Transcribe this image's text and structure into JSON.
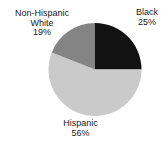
{
  "chart_data": {
    "type": "pie",
    "title": "",
    "legend": "none",
    "start_angle_deg": 0,
    "direction": "clockwise",
    "slices": [
      {
        "label": "Black",
        "display_lines": [
          "Black"
        ],
        "pct_label": "25%",
        "value": 25,
        "color": "#121212"
      },
      {
        "label": "Hispanic",
        "display_lines": [
          "Hispanic"
        ],
        "pct_label": "56%",
        "value": 56,
        "color": "#cacaca"
      },
      {
        "label": "Non-Hispanic White",
        "display_lines": [
          "Non-Hispanic",
          "White"
        ],
        "pct_label": "19%",
        "value": 19,
        "color": "#848484"
      }
    ],
    "geometry": {
      "cx": 95,
      "cy": 69.5,
      "r": 46.5
    }
  }
}
